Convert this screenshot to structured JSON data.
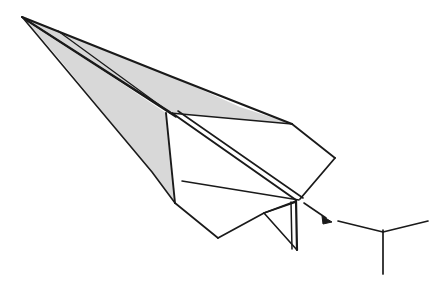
{
  "figure": {
    "background_color": "#ffffff",
    "stroke_color": "#1a1a1a",
    "shade_color": "#d8d8d8",
    "shade_color_dark": "#cfcfcf",
    "canvas": {
      "width": 435,
      "height": 292
    }
  },
  "airplane": {
    "label": "paper-dart-glider",
    "nose_tip": {
      "x": 22,
      "y": 17
    },
    "parts": [
      {
        "name": "upper-wing-panel",
        "label": "Upper wing panel (shaded)",
        "fill": "#d8d8d8",
        "points": "22,17 170,113 292,124 240,107 178,79"
      },
      {
        "name": "nose-spine-sliver",
        "label": "Nose spine sliver (shaded)",
        "fill": "#d8d8d8",
        "points": "22,17 60,32 172,112 166,113"
      },
      {
        "name": "left-body-panel",
        "label": "Left body panel (shaded)",
        "fill": "#d8d8d8",
        "points": "24,18 166,113 175,203 150,170"
      },
      {
        "name": "tail-fin",
        "label": "Rear vertical tail fin (shaded)",
        "fill": "#d0d0d0",
        "points": "265,212 296,202 297,250"
      },
      {
        "name": "right-wing-underside",
        "label": "Right wing underside (white)",
        "fill": "#ffffff",
        "points": "172,113 292,124 335,158 303,198 183,181"
      },
      {
        "name": "fuselage-underbelly",
        "label": "Fuselage underbelly (white)",
        "fill": "#ffffff",
        "points": "175,203 183,181 299,200 297,250 218,238"
      }
    ],
    "fold_lines": [
      {
        "name": "spine-crease-upper",
        "from": {
          "x": 22,
          "y": 17
        },
        "to": {
          "x": 172,
          "y": 113
        }
      },
      {
        "name": "spine-crease-lower",
        "from": {
          "x": 26,
          "y": 20
        },
        "to": {
          "x": 176,
          "y": 117
        }
      },
      {
        "name": "wing-root-crease",
        "from": {
          "x": 172,
          "y": 113
        },
        "to": {
          "x": 299,
          "y": 200
        }
      },
      {
        "name": "wing-root-crease-2",
        "from": {
          "x": 177,
          "y": 112
        },
        "to": {
          "x": 303,
          "y": 199
        }
      },
      {
        "name": "leading-edge-right",
        "from": {
          "x": 22,
          "y": 17
        },
        "to": {
          "x": 292,
          "y": 124
        }
      },
      {
        "name": "wing-trailing-edge",
        "from": {
          "x": 292,
          "y": 124
        },
        "to": {
          "x": 335,
          "y": 158
        }
      },
      {
        "name": "wing-tip-return",
        "from": {
          "x": 335,
          "y": 158
        },
        "to": {
          "x": 299,
          "y": 200
        }
      },
      {
        "name": "body-lower-edge",
        "from": {
          "x": 175,
          "y": 203
        },
        "to": {
          "x": 218,
          "y": 238
        }
      },
      {
        "name": "body-rear-edge",
        "from": {
          "x": 218,
          "y": 238
        },
        "to": {
          "x": 297,
          "y": 250
        }
      },
      {
        "name": "fin-edge",
        "from": {
          "x": 296,
          "y": 200
        },
        "to": {
          "x": 297,
          "y": 250
        }
      },
      {
        "name": "nose-inner-crease",
        "from": {
          "x": 60,
          "y": 32
        },
        "to": {
          "x": 170,
          "y": 113
        }
      }
    ]
  },
  "callout": {
    "arrow": {
      "name": "cross-section-arrow",
      "label": "Arrow pointing to cross-section",
      "from": {
        "x": 304,
        "y": 203
      },
      "to": {
        "x": 331,
        "y": 221
      }
    },
    "cross_section": {
      "name": "tail-cross-section",
      "label": "Rear cross-section profile (dihedral)",
      "left_tip": {
        "x": 338,
        "y": 221
      },
      "center": {
        "x": 383,
        "y": 232
      },
      "right_tip": {
        "x": 428,
        "y": 221
      },
      "stem_bottom": {
        "x": 383,
        "y": 274
      }
    }
  },
  "caption": {
    "ghost_text": ""
  }
}
